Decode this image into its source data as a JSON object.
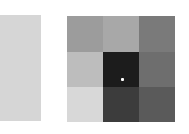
{
  "reference_swatch": {
    "color": "#d6d6d6"
  },
  "grid": {
    "rows": 3,
    "cols": 3,
    "cells": [
      [
        "#9c9c9c",
        "#a8a8a8",
        "#7a7a7a"
      ],
      [
        "#bdbdbd",
        "#1c1c1c",
        "#6e6e6e"
      ],
      [
        "#d8d8d8",
        "#3c3c3c",
        "#5a5a5a"
      ]
    ]
  },
  "marker": {
    "color": "#ffffff",
    "cell": [
      1,
      1
    ]
  }
}
